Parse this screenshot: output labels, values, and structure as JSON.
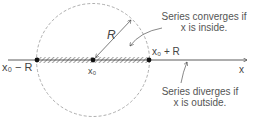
{
  "diagram": {
    "labels": {
      "left_endpoint": "x₀ − R",
      "center": "x₀",
      "right_endpoint": "x₀ + R",
      "radius": "R",
      "axis": "x"
    },
    "annotations": {
      "converges_line1": "Series converges if",
      "converges_line2": "x is inside.",
      "diverges_line1": "Series diverges if",
      "diverges_line2": "x is outside."
    },
    "colors": {
      "line": "#333333",
      "circle": "#999999",
      "text": "#444444"
    }
  }
}
